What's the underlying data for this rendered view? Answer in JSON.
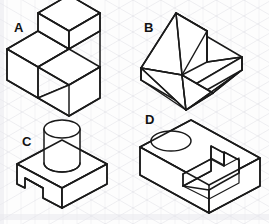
{
  "page": {
    "background_color": "#fdfdfd",
    "grid_color": "#c9c9d4",
    "line_color": "#1a1a1a",
    "width": 269,
    "height": 224
  },
  "grid": {
    "type": "isometric-triangle",
    "spacing_px": 14,
    "visible": true
  },
  "figures": [
    {
      "id": "A",
      "label": "A",
      "label_x": 14,
      "label_y": 32,
      "description": "Two-level stepped block: a raised cubic step at the rear-left sitting on a rectangular base, forming an L-shaped step profile",
      "quadrant": "top-left"
    },
    {
      "id": "B",
      "label": "B",
      "label_x": 144,
      "label_y": 32,
      "description": "Angled wedge plate: a flat rectangular base with an inclined triangular ramp rising from the left side and a V-groove channel cut through the base",
      "quadrant": "top-right"
    },
    {
      "id": "C",
      "label": "C",
      "label_x": 22,
      "label_y": 146,
      "description": "Rectangular base block with a vertical cylindrical boss on top and a rectangular notch cut in the lower front-left face",
      "quadrant": "bottom-left"
    },
    {
      "id": "D",
      "label": "D",
      "label_x": 145,
      "label_y": 124,
      "description": "Rectangular block with a circular through-hole in the top face and a stepped rectangular pocket milled into the top-right region",
      "quadrant": "bottom-right"
    }
  ]
}
